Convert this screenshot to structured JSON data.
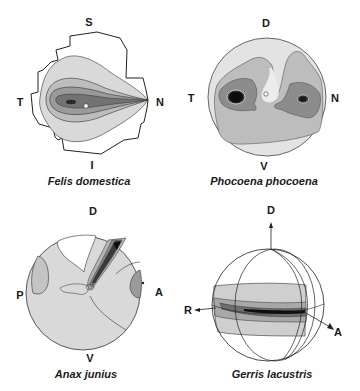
{
  "figure": {
    "panels": [
      {
        "id": "felis",
        "caption": "Felis domestica",
        "labels": {
          "top": "S",
          "left": "T",
          "right": "N",
          "bottom": "I"
        }
      },
      {
        "id": "phocoena",
        "caption": "Phocoena phocoena",
        "labels": {
          "top": "D",
          "left": "T",
          "right": "N",
          "bottom": "V"
        }
      },
      {
        "id": "anax",
        "caption": "Anax junius",
        "labels": {
          "top": "D",
          "left": "P",
          "right": "A",
          "bottom": "V"
        }
      },
      {
        "id": "gerris",
        "caption": "Gerris lacustris",
        "labels": {
          "top": "D",
          "left": "R",
          "right": "A"
        }
      }
    ],
    "colors": {
      "level0": "#ffffff",
      "level1": "#d9d9d9",
      "level2": "#bdbdbd",
      "level3": "#9a9a9a",
      "level4": "#737373",
      "level5": "#3a3a3a",
      "level6": "#0d0d0d",
      "outline": "#222222"
    }
  }
}
